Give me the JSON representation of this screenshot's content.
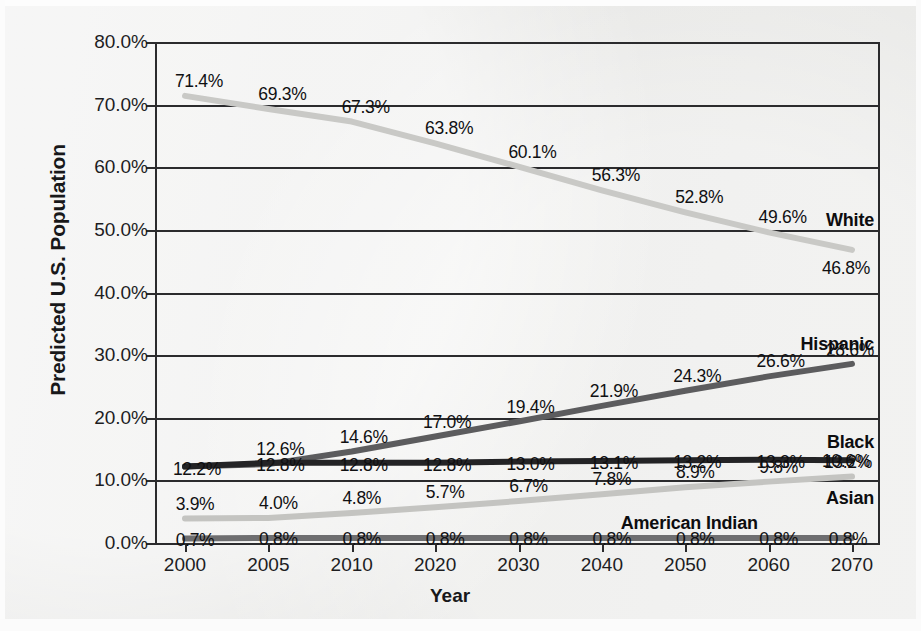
{
  "chart_data": {
    "type": "line",
    "title": "",
    "xlabel": "Year",
    "ylabel": "Predicted U.S. Population",
    "categories": [
      "2000",
      "2005",
      "2010",
      "2020",
      "2030",
      "2040",
      "2050",
      "2060",
      "2070"
    ],
    "ylim": [
      0,
      80
    ],
    "ytick_labels": [
      "0.0%",
      "10.0%",
      "20.0%",
      "30.0%",
      "40.0%",
      "50.0%",
      "60.0%",
      "70.0%",
      "80.0%"
    ],
    "ytick_values": [
      0,
      10,
      20,
      30,
      40,
      50,
      60,
      70,
      80
    ],
    "grid": true,
    "legend_position": "inline-right-end-labels",
    "series": [
      {
        "name": "White",
        "color": "#c9c9c6",
        "values": [
          71.4,
          69.3,
          67.3,
          63.8,
          60.1,
          56.3,
          52.8,
          49.6,
          46.8
        ],
        "labels": [
          "71.4%",
          "69.3%",
          "67.3%",
          "63.8%",
          "60.1%",
          "56.3%",
          "52.8%",
          "49.6%",
          "46.8%"
        ]
      },
      {
        "name": "Hispanic",
        "color": "#5c5c5e",
        "values": [
          12.2,
          12.6,
          14.6,
          17.0,
          19.4,
          21.9,
          24.3,
          26.6,
          28.6
        ],
        "labels": [
          "12.2%",
          "12.6%",
          "14.6%",
          "17.0%",
          "19.4%",
          "21.9%",
          "24.3%",
          "26.6%",
          "28.6%"
        ]
      },
      {
        "name": "Black",
        "color": "#232325",
        "values": [
          12.2,
          12.8,
          12.8,
          12.8,
          13.0,
          13.1,
          13.2,
          13.3,
          13.2
        ],
        "labels": [
          "12.2%",
          "12.8%",
          "12.8%",
          "12.8%",
          "13.0%",
          "13.1%",
          "13.2%",
          "13.3%",
          "13.2%"
        ]
      },
      {
        "name": "Asian",
        "color": "#c4c4c1",
        "values": [
          3.9,
          4.0,
          4.8,
          5.7,
          6.7,
          7.8,
          8.9,
          9.8,
          10.6
        ],
        "labels": [
          "3.9%",
          "4.0%",
          "4.8%",
          "5.7%",
          "6.7%",
          "7.8%",
          "8.9%",
          "9.8%",
          "10.6%"
        ]
      },
      {
        "name": "American Indian",
        "color": "#6e6e70",
        "values": [
          0.7,
          0.8,
          0.8,
          0.8,
          0.8,
          0.8,
          0.8,
          0.8,
          0.8
        ],
        "labels": [
          "0.7%",
          "0.8%",
          "0.8%",
          "0.8%",
          "0.8%",
          "0.8%",
          "0.8%",
          "0.8%",
          "0.8%"
        ]
      }
    ],
    "series_end_labels": [
      {
        "name": "White",
        "text": "White"
      },
      {
        "name": "Hispanic",
        "text": "Hispanic"
      },
      {
        "name": "Black",
        "text": "Black"
      },
      {
        "name": "Asian",
        "text": "Asian"
      },
      {
        "name": "American Indian",
        "text": "American Indian"
      }
    ]
  }
}
